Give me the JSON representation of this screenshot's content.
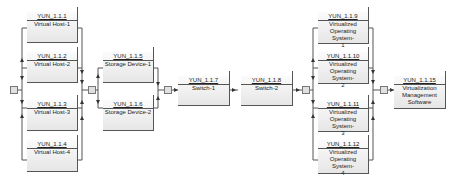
{
  "diagram": {
    "type": "reliability-block-diagram",
    "stages": [
      {
        "name": "virtual-hosts",
        "arrangement": "parallel",
        "nodes": [
          {
            "id": "YUN_1.1.1",
            "label": "Virtual Host-1"
          },
          {
            "id": "YUN_1.1.2",
            "label": "Virtual Host-2"
          },
          {
            "id": "YUN_1.1.3",
            "label": "Virtual Host-3"
          },
          {
            "id": "YUN_1.1.4",
            "label": "Virtual Host-4"
          }
        ]
      },
      {
        "name": "storage-devices",
        "arrangement": "parallel",
        "nodes": [
          {
            "id": "YUN_1.1.5",
            "label": "Storage Device-1"
          },
          {
            "id": "YUN_1.1.6",
            "label": "Storage Device-2"
          }
        ]
      },
      {
        "name": "switch-1",
        "arrangement": "series",
        "nodes": [
          {
            "id": "YUN_1.1.7",
            "label": "Switch-1"
          }
        ]
      },
      {
        "name": "switch-2",
        "arrangement": "series",
        "nodes": [
          {
            "id": "YUN_1.1.8",
            "label": "Switch-2"
          }
        ]
      },
      {
        "name": "virtualized-os",
        "arrangement": "parallel",
        "nodes": [
          {
            "id": "YUN_1.1.9",
            "label": "Virtualized\nOperating System-\n1"
          },
          {
            "id": "YUN_1.1.10",
            "label": "Virtualized\nOperating System-\n2"
          },
          {
            "id": "YUN_1.1.11",
            "label": "Virtualized\nOperating System-\n3"
          },
          {
            "id": "YUN_1.1.12",
            "label": "Virtualized\nOperating System-\n4"
          }
        ]
      },
      {
        "name": "management",
        "arrangement": "series",
        "nodes": [
          {
            "id": "YUN_1.1.15",
            "label": "Virtualization\nManagement\nSoftware"
          }
        ]
      }
    ],
    "colors": {
      "line": "#555555",
      "node_fill_top": "#fbfbfb",
      "node_fill_bottom": "#e6e6e6",
      "junction_fill": "#e0e0e0"
    }
  }
}
